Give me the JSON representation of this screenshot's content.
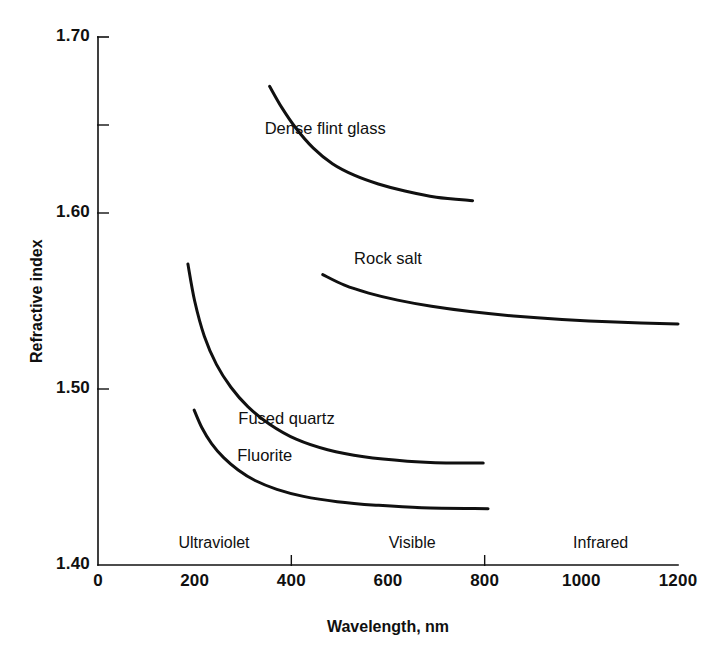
{
  "chart_data": {
    "type": "line",
    "title": "",
    "xlabel": "Wavelength, nm",
    "ylabel": "Refractive index",
    "xlim": [
      0,
      1200
    ],
    "ylim": [
      1.4,
      1.7
    ],
    "grid": false,
    "legend_position": "inline-curve-labels",
    "x_ticks": [
      {
        "value": 0,
        "label": "0"
      },
      {
        "value": 200,
        "label": "200"
      },
      {
        "value": 400,
        "label": "400"
      },
      {
        "value": 600,
        "label": "600"
      },
      {
        "value": 800,
        "label": "800"
      },
      {
        "value": 1000,
        "label": "1000"
      },
      {
        "value": 1200,
        "label": "1200"
      }
    ],
    "x_major_ticks": [
      400,
      800
    ],
    "y_ticks": [
      {
        "value": 1.4,
        "label": "1.40"
      },
      {
        "value": 1.5,
        "label": "1.50"
      },
      {
        "value": 1.6,
        "label": "1.60"
      },
      {
        "value": 1.7,
        "label": "1.70"
      }
    ],
    "y_minor_ticks": [
      1.65
    ],
    "annotations": [
      {
        "name": "ultraviolet",
        "text": "Ultraviolet",
        "x": 240,
        "y": 1.408
      },
      {
        "name": "visible",
        "text": "Visible",
        "x": 650,
        "y": 1.408
      },
      {
        "name": "infrared",
        "text": "Infrared",
        "x": 1040,
        "y": 1.408
      }
    ],
    "series": [
      {
        "name": "Dense flint glass",
        "label": "Dense flint glass",
        "color": "#101010",
        "label_x": 470,
        "label_y": 1.648,
        "points": [
          {
            "x": 355,
            "y": 1.672
          },
          {
            "x": 380,
            "y": 1.66
          },
          {
            "x": 410,
            "y": 1.648
          },
          {
            "x": 445,
            "y": 1.637
          },
          {
            "x": 485,
            "y": 1.628
          },
          {
            "x": 530,
            "y": 1.6215
          },
          {
            "x": 580,
            "y": 1.6165
          },
          {
            "x": 635,
            "y": 1.6125
          },
          {
            "x": 700,
            "y": 1.609
          },
          {
            "x": 775,
            "y": 1.607
          }
        ]
      },
      {
        "name": "Rock salt",
        "label": "Rock salt",
        "color": "#101010",
        "label_x": 600,
        "label_y": 1.574,
        "points": [
          {
            "x": 465,
            "y": 1.565
          },
          {
            "x": 510,
            "y": 1.559
          },
          {
            "x": 560,
            "y": 1.5545
          },
          {
            "x": 620,
            "y": 1.5505
          },
          {
            "x": 690,
            "y": 1.547
          },
          {
            "x": 770,
            "y": 1.544
          },
          {
            "x": 860,
            "y": 1.5415
          },
          {
            "x": 960,
            "y": 1.5395
          },
          {
            "x": 1070,
            "y": 1.538
          },
          {
            "x": 1200,
            "y": 1.537
          }
        ]
      },
      {
        "name": "Fused quartz",
        "label": "Fused quartz",
        "color": "#101010",
        "label_x": 390,
        "label_y": 1.483,
        "points": [
          {
            "x": 186,
            "y": 1.571
          },
          {
            "x": 200,
            "y": 1.55
          },
          {
            "x": 220,
            "y": 1.53
          },
          {
            "x": 245,
            "y": 1.514
          },
          {
            "x": 275,
            "y": 1.501
          },
          {
            "x": 310,
            "y": 1.49
          },
          {
            "x": 355,
            "y": 1.48
          },
          {
            "x": 410,
            "y": 1.4715
          },
          {
            "x": 475,
            "y": 1.4655
          },
          {
            "x": 550,
            "y": 1.4615
          },
          {
            "x": 640,
            "y": 1.459
          },
          {
            "x": 720,
            "y": 1.458
          },
          {
            "x": 797,
            "y": 1.458
          }
        ]
      },
      {
        "name": "Fluorite",
        "label": "Fluorite",
        "color": "#101010",
        "label_x": 345,
        "label_y": 1.462,
        "points": [
          {
            "x": 199,
            "y": 1.488
          },
          {
            "x": 215,
            "y": 1.478
          },
          {
            "x": 235,
            "y": 1.469
          },
          {
            "x": 260,
            "y": 1.461
          },
          {
            "x": 290,
            "y": 1.454
          },
          {
            "x": 325,
            "y": 1.448
          },
          {
            "x": 370,
            "y": 1.443
          },
          {
            "x": 425,
            "y": 1.439
          },
          {
            "x": 495,
            "y": 1.436
          },
          {
            "x": 575,
            "y": 1.434
          },
          {
            "x": 670,
            "y": 1.4325
          },
          {
            "x": 807,
            "y": 1.432
          }
        ]
      }
    ]
  },
  "plot_geometry": {
    "left": 98,
    "right": 678,
    "top": 37,
    "bottom": 565
  }
}
